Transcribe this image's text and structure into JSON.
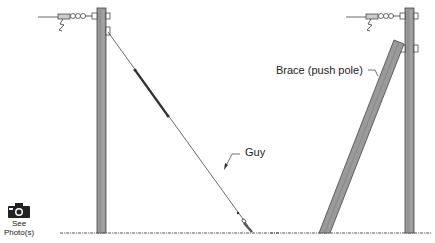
{
  "diagram": {
    "labels": {
      "guy": "Guy",
      "brace": "Brace (push pole)"
    },
    "photo_button": {
      "line1": "See",
      "line2": "Photo(s)",
      "icon": "camera-icon"
    },
    "colors": {
      "line": "#333333",
      "pole_fill": "#9a9a9a",
      "pole_dark": "#555555",
      "background": "#ffffff"
    }
  }
}
